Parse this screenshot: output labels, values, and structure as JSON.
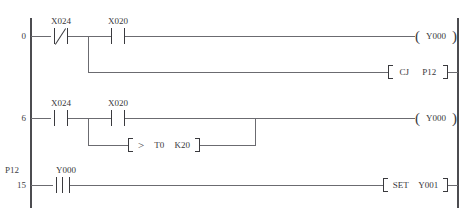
{
  "diagram": {
    "left_rail": "left-power-rail",
    "right_rail": "right-power-rail"
  },
  "rungs": [
    {
      "step": "0",
      "pointer_label": "",
      "branches": [
        {
          "contacts": [
            {
              "device": "X024",
              "type": "normally-closed"
            },
            {
              "device": "X020",
              "type": "normally-open"
            }
          ],
          "output": {
            "kind": "coil",
            "device": "Y000"
          }
        },
        {
          "contacts": [],
          "output": {
            "kind": "instruction",
            "mnemonic": "CJ",
            "operand": "P12"
          }
        }
      ]
    },
    {
      "step": "6",
      "pointer_label": "",
      "branches": [
        {
          "contacts": [
            {
              "device": "X024",
              "type": "normally-open"
            },
            {
              "device": "X020",
              "type": "normally-open"
            }
          ],
          "output": {
            "kind": "coil",
            "device": "Y000"
          }
        },
        {
          "contacts": [],
          "output": {
            "kind": "compare",
            "operator": ">",
            "operand1": "T0",
            "operand2": "K20"
          }
        }
      ]
    },
    {
      "step": "15",
      "pointer_label": "P12",
      "branches": [
        {
          "contacts": [
            {
              "device": "Y000",
              "type": "rising-edge-pulse"
            }
          ],
          "output": {
            "kind": "instruction",
            "mnemonic": "SET",
            "operand": "Y001"
          }
        }
      ]
    }
  ],
  "labels": {
    "r0_step": "0",
    "r0_c1_device": "X024",
    "r0_c2_device": "X020",
    "r0_coil_device": "Y000",
    "r0_cj_mnemonic": "CJ",
    "r0_cj_operand": "P12",
    "r1_step": "6",
    "r1_c1_device": "X024",
    "r1_c2_device": "X020",
    "r1_coil_device": "Y000",
    "r1_cmp_operator": ">",
    "r1_cmp_operand1": "T0",
    "r1_cmp_operand2": "K20",
    "r2_step": "15",
    "r2_pointer": "P12",
    "r2_c1_device": "Y000",
    "r2_set_mnemonic": "SET",
    "r2_set_operand": "Y001"
  },
  "colors": {
    "rail": "#4c4c50",
    "wire": "#6b6b70",
    "symbol": "#3a3a3e",
    "text": "#37373b",
    "background": "#ffffff"
  }
}
